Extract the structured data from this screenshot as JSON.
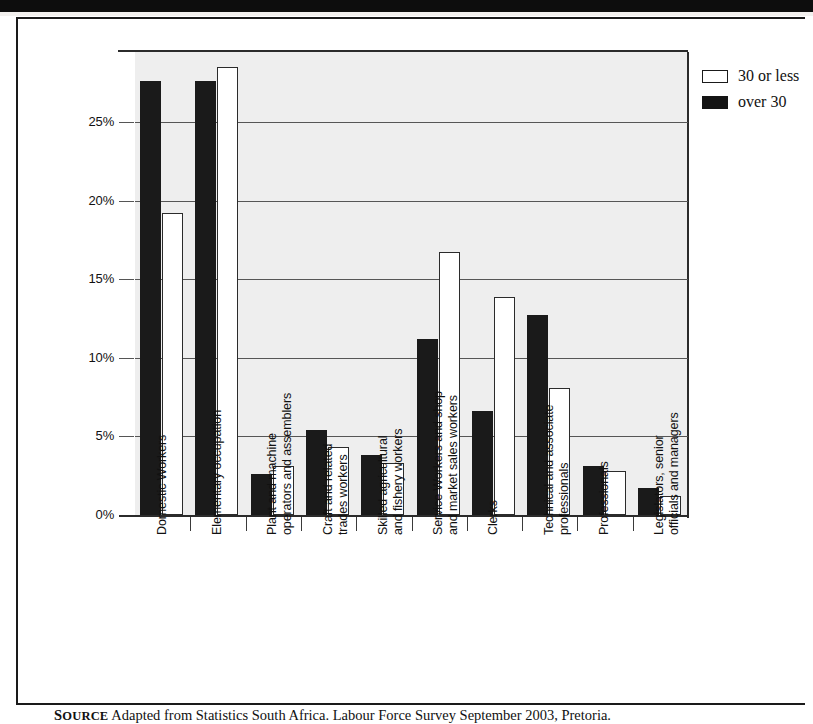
{
  "figure": {
    "source_kicker_first": "S",
    "source_kicker_rest": "OURCE",
    "source_text": " Adapted from Statistics South Africa. Labour Force Survey September 2003, Pretoria."
  },
  "legend": {
    "position": "top-right",
    "items": [
      {
        "label": "30 or less",
        "swatch": "white-square-icon",
        "color": "#ffffff"
      },
      {
        "label": "over 30",
        "swatch": "black-square-icon",
        "color": "#141414"
      }
    ]
  },
  "chart_data": {
    "type": "bar",
    "title": "",
    "subtitle": "",
    "xlabel": "",
    "ylabel": "",
    "ylim": [
      0,
      28.5
    ],
    "grid": true,
    "yticks": [
      "0%",
      "5%",
      "10%",
      "15%",
      "20%",
      "25%"
    ],
    "ytick_values": [
      0,
      5,
      10,
      15,
      20,
      25
    ],
    "legend_position": "top-right",
    "categories": [
      "Domestic Workers",
      "Elementary occupation",
      "Plant and machine operators and assemblers",
      "Craft and related trades workers",
      "Skilled agricultural and fishery workers",
      "Service Workers and shop and market sales workers",
      "Clerks",
      "Technical and associate professionals",
      "Professionals",
      "Legislators, senior officials and managers"
    ],
    "category_lines": [
      [
        "Domestic Workers",
        ""
      ],
      [
        "Elementary occupation",
        ""
      ],
      [
        "Plant and machine",
        "operators and assemblers"
      ],
      [
        "Craft and related",
        "trades workers"
      ],
      [
        "Skilled agricultural",
        "and fishery workers"
      ],
      [
        "Service Workers and shop",
        "and market sales workers"
      ],
      [
        "Clerks",
        ""
      ],
      [
        "Technical and associate",
        "professionals"
      ],
      [
        "Professionals",
        ""
      ],
      [
        "Legislators, senior",
        "officials and managers"
      ]
    ],
    "series": [
      {
        "name": "over 30",
        "color": "#1a1a1a",
        "values": [
          27.6,
          27.6,
          2.6,
          5.4,
          3.8,
          11.2,
          6.6,
          12.7,
          3.1,
          1.7
        ]
      },
      {
        "name": "30 or less",
        "color": "#ffffff",
        "values": [
          19.2,
          28.5,
          3.1,
          4.3,
          3.3,
          16.7,
          13.9,
          8.1,
          2.8,
          1.2
        ]
      }
    ]
  }
}
